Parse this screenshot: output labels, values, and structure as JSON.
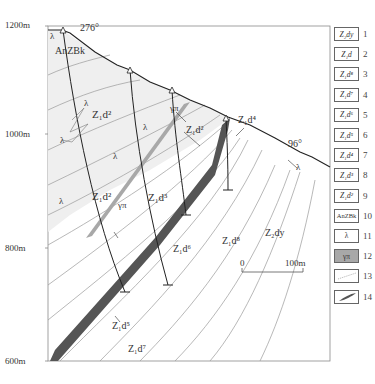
{
  "figure": {
    "elevation_labels": [
      "1200m",
      "1000m",
      "800m",
      "600m"
    ],
    "azimuth_left": "276°",
    "azimuth_right": "96°",
    "scale_bar": {
      "start": "0",
      "end": "100m"
    },
    "map_labels": {
      "anzbk": "AnZBk",
      "z1d2_upper": "Z₁d²",
      "z1d2_mid": "Z₁d²",
      "z1d2_right": "Z₁d²",
      "z1d3": "Z₁d³",
      "z1d4": "Z₁d⁴",
      "z1d5": "Z₁d⁵",
      "z1d6": "Z₁d⁶",
      "z1d7": "Z₁d⁷",
      "z1d8": "Z₁d⁸",
      "z2dy": "Z₂dy",
      "lambda": "λ",
      "gamma_pi": "γπ"
    }
  },
  "legend": {
    "items": [
      {
        "num": "1",
        "label": "Z₂dy"
      },
      {
        "num": "2",
        "label": "Z₁d"
      },
      {
        "num": "3",
        "label": "Z₁d⁸"
      },
      {
        "num": "4",
        "label": "Z₁d⁷"
      },
      {
        "num": "5",
        "label": "Z₁d⁶"
      },
      {
        "num": "6",
        "label": "Z₁d⁵"
      },
      {
        "num": "7",
        "label": "Z₁d⁴"
      },
      {
        "num": "8",
        "label": "Z₁d³"
      },
      {
        "num": "9",
        "label": "Z₁d²"
      },
      {
        "num": "10",
        "label": "AnZBk"
      },
      {
        "num": "11",
        "label": "λ"
      },
      {
        "num": "12",
        "label": "γπ"
      },
      {
        "num": "13",
        "label": ""
      },
      {
        "num": "14",
        "label": ""
      }
    ]
  },
  "colors": {
    "frame": "#888888",
    "topography": "#222222",
    "contact": "#9a9a9a",
    "ore_body": "#555555",
    "dike": "#a8a8a8",
    "shaded_unit": "#efefef"
  }
}
